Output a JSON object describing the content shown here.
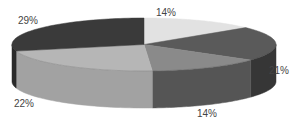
{
  "chart_data": {
    "type": "pie",
    "style": "3d",
    "title": "",
    "slices": [
      {
        "label": "14%",
        "value": 14,
        "top_color": "#e2e2e2",
        "side_color": "#c8c8c8"
      },
      {
        "label": "21%",
        "value": 21,
        "top_color": "#5a5a5a",
        "side_color": "#363636"
      },
      {
        "label": "14%",
        "value": 14,
        "top_color": "#8a8a8a",
        "side_color": "#555555"
      },
      {
        "label": "22%",
        "value": 22,
        "top_color": "#b6b6b6",
        "side_color": "#a2a2a2"
      },
      {
        "label": "29%",
        "value": 29,
        "top_color": "#3a3a3a",
        "side_color": "#2a2a2a"
      }
    ],
    "legend": "none",
    "start_angle": "12 o'clock",
    "direction": "clockwise"
  },
  "geometry": {
    "cx": 144,
    "cy": 44.5,
    "rx": 132,
    "ry": 26.5,
    "depth": 37
  },
  "label_positions": [
    {
      "x": 166,
      "y": 16
    },
    {
      "x": 279,
      "y": 74
    },
    {
      "x": 207,
      "y": 117
    },
    {
      "x": 24,
      "y": 107
    },
    {
      "x": 28,
      "y": 24
    }
  ]
}
